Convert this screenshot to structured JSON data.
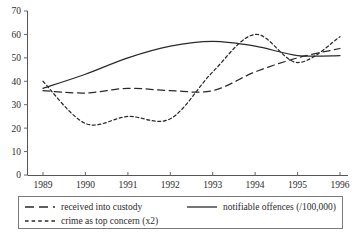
{
  "chart_data": {
    "type": "line",
    "title": "",
    "xlabel": "",
    "ylabel": "",
    "xlim": [
      1989,
      1996
    ],
    "ylim": [
      0,
      70
    ],
    "grid": false,
    "legend_position": "bottom",
    "categories": [
      "1989",
      "1990",
      "1991",
      "1992",
      "1993",
      "1994",
      "1995",
      "1996"
    ],
    "x": [
      1989,
      1990,
      1991,
      1992,
      1993,
      1994,
      1995,
      1996
    ],
    "yticks": [
      "0",
      "10",
      "20",
      "30",
      "40",
      "50",
      "60",
      "70"
    ],
    "ytick_values": [
      0,
      10,
      20,
      30,
      40,
      50,
      60,
      70
    ],
    "series": [
      {
        "name": "received into custody",
        "style": "long-dash",
        "values": [
          36,
          35,
          37,
          36,
          36,
          44,
          50,
          54
        ]
      },
      {
        "name": "notifiable offences (/100,000)",
        "style": "solid",
        "values": [
          37,
          43,
          50,
          55,
          57,
          55,
          51,
          51
        ]
      },
      {
        "name": "crime as top concern (x2)",
        "style": "short-dash",
        "values": [
          40,
          22,
          25,
          24,
          44,
          60,
          48,
          59
        ]
      }
    ],
    "annotations": {
      "solid_peak": {
        "x": 1992.5,
        "y": 57
      },
      "shortdash_trough": {
        "x": 1990.0,
        "y": 21.5
      },
      "shortdash_peak": {
        "x": 1993.6,
        "y": 61
      }
    }
  },
  "legend": {
    "entries": [
      {
        "label": "received into custody",
        "style": "long-dash"
      },
      {
        "label": "notifiable offences (/100,000)",
        "style": "solid"
      },
      {
        "label": "crime as top concern (x2)",
        "style": "short-dash"
      }
    ]
  },
  "colors": {
    "line": "#2a2a2a",
    "axis": "#555555",
    "text": "#2b2b2b",
    "legend_border": "#7a7a7a",
    "background": "#ffffff"
  }
}
